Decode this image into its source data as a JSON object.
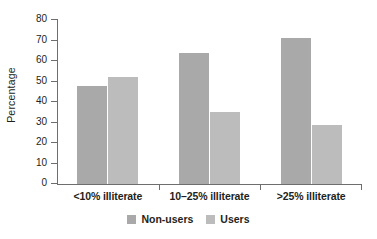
{
  "chart_data": {
    "type": "bar",
    "title": "",
    "subtitle": "",
    "xlabel": "",
    "ylabel": "Percentage",
    "categories": [
      "<10% illiterate",
      "10–25% illiterate",
      ">25% illiterate"
    ],
    "series": [
      {
        "name": "Non-users",
        "values": [
          48,
          64,
          71
        ],
        "color": "#a9a9a9"
      },
      {
        "name": "Users",
        "values": [
          52,
          35,
          29
        ],
        "color": "#bcbcbc"
      }
    ],
    "ylim": [
      0,
      80
    ],
    "ytick_step": 10,
    "yticks": [
      0,
      10,
      20,
      30,
      40,
      50,
      60,
      70,
      80
    ],
    "ytick_labels": [
      "0",
      "10",
      "20",
      "30",
      "40",
      "50",
      "60",
      "70",
      "80"
    ],
    "grid": false,
    "legend_position": "bottom-center",
    "axis_color": "#6e6e6e",
    "background": "#ffffff",
    "annotations": []
  },
  "legend": {
    "items": [
      {
        "label": "Non-users",
        "color": "#a9a9a9"
      },
      {
        "label": "Users",
        "color": "#bcbcbc"
      }
    ]
  }
}
